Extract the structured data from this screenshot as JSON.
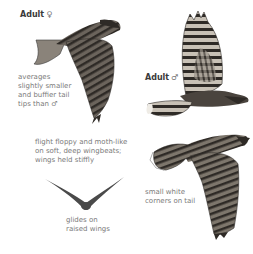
{
  "plate": {
    "female": {
      "heading": "Adult",
      "sex_symbol": "♀",
      "note_lines": [
        "averages",
        "slightly smaller",
        "and buffier tail",
        "tips than ♂"
      ]
    },
    "male": {
      "heading": "Adult",
      "sex_symbol": "♂"
    },
    "flight_note": {
      "lines": [
        "flight floppy and moth-like",
        "on soft, deep wingbeats;",
        "wings held stiffly"
      ]
    },
    "glide_note": {
      "lines": [
        "glides on",
        "raised wings"
      ]
    },
    "tail_note": {
      "lines": [
        "small white",
        "corners on tail"
      ]
    },
    "colors": {
      "text": "#7a7a7a",
      "heading": "#3a3a3a",
      "bird_dark": "#2e2a26",
      "bird_mid": "#6b645c",
      "bird_light": "#bdb6ac",
      "silhouette": "#4a4a4a"
    }
  }
}
